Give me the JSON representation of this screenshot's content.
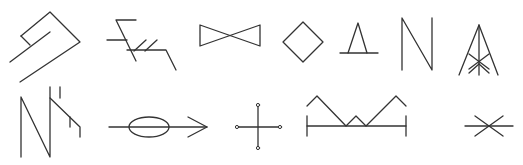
{
  "figure": {
    "type": "symbol-set",
    "stroke_color": "#333333",
    "background": "#ffffff",
    "rows": [
      {
        "row": 1,
        "symbols": [
          {
            "id": "s1",
            "name": "hooked-parallel-strokes"
          },
          {
            "id": "s2",
            "name": "branch-with-hatching"
          },
          {
            "id": "s3",
            "name": "bowtie"
          },
          {
            "id": "s4",
            "name": "diamond"
          },
          {
            "id": "s5",
            "name": "triangle-on-baseline"
          },
          {
            "id": "s6",
            "name": "n-shape"
          },
          {
            "id": "s7",
            "name": "tower-frame"
          }
        ]
      },
      {
        "row": 2,
        "symbols": [
          {
            "id": "s8",
            "name": "n-with-ticks"
          },
          {
            "id": "s9",
            "name": "ellipse-arrow"
          },
          {
            "id": "s10",
            "name": "cross-with-end-dots"
          },
          {
            "id": "s11",
            "name": "zigzag-over-bracket"
          },
          {
            "id": "s12",
            "name": "asterisk-cross"
          }
        ]
      }
    ]
  }
}
